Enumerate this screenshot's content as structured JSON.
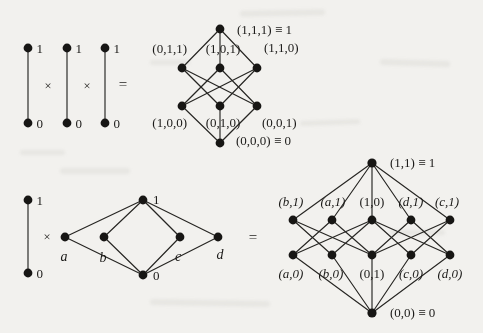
{
  "colors": {
    "paper": "#f2f1ee",
    "ink": "#1b1a18"
  },
  "operators": {
    "times": "×",
    "equals": "="
  },
  "chain": {
    "top_label": "1",
    "bottom_label": "0"
  },
  "top_figure": {
    "cube_labels": {
      "top": "(1,1,1) ≡ 1",
      "coatoms": [
        "(0,1,1)",
        "(1,0,1)",
        "(1,1,0)"
      ],
      "atoms": [
        "(1,0,0)",
        "(0,1,0)",
        "(0,0,1)"
      ],
      "bottom": "(0,0,0) ≡ 0"
    },
    "cube_edges": [
      [
        "(1,1,1)",
        "(0,1,1)"
      ],
      [
        "(1,1,1)",
        "(1,0,1)"
      ],
      [
        "(1,1,1)",
        "(1,1,0)"
      ],
      [
        "(0,1,1)",
        "(0,1,0)"
      ],
      [
        "(0,1,1)",
        "(0,0,1)"
      ],
      [
        "(1,0,1)",
        "(1,0,0)"
      ],
      [
        "(1,0,1)",
        "(0,0,1)"
      ],
      [
        "(1,1,0)",
        "(1,0,0)"
      ],
      [
        "(1,1,0)",
        "(0,1,0)"
      ],
      [
        "(1,0,0)",
        "(0,0,0)"
      ],
      [
        "(0,1,0)",
        "(0,0,0)"
      ],
      [
        "(0,0,1)",
        "(0,0,0)"
      ]
    ]
  },
  "bottom_figure": {
    "m_poset": {
      "top": "1",
      "bottom": "0",
      "atoms": [
        "a",
        "b",
        "c",
        "d"
      ]
    },
    "product": {
      "top": "(1,1) ≡ 1",
      "upper": [
        "(b,1)",
        "(a,1)",
        "(1,0)",
        "(d,1)",
        "(c,1)"
      ],
      "lower": [
        "(a,0)",
        "(b,0)",
        "(0,1)",
        "(c,0)",
        "(d,0)"
      ],
      "bottom": "(0,0) ≡ 0",
      "edges": [
        [
          "(1,1)",
          "(b,1)"
        ],
        [
          "(1,1)",
          "(a,1)"
        ],
        [
          "(1,1)",
          "(1,0)"
        ],
        [
          "(1,1)",
          "(d,1)"
        ],
        [
          "(1,1)",
          "(c,1)"
        ],
        [
          "(b,1)",
          "(b,0)"
        ],
        [
          "(b,1)",
          "(0,1)"
        ],
        [
          "(a,1)",
          "(a,0)"
        ],
        [
          "(a,1)",
          "(0,1)"
        ],
        [
          "(1,0)",
          "(a,0)"
        ],
        [
          "(1,0)",
          "(b,0)"
        ],
        [
          "(1,0)",
          "(c,0)"
        ],
        [
          "(1,0)",
          "(d,0)"
        ],
        [
          "(d,1)",
          "(0,1)"
        ],
        [
          "(d,1)",
          "(d,0)"
        ],
        [
          "(c,1)",
          "(0,1)"
        ],
        [
          "(c,1)",
          "(c,0)"
        ],
        [
          "(a,0)",
          "(0,0)"
        ],
        [
          "(b,0)",
          "(0,0)"
        ],
        [
          "(0,1)",
          "(0,0)"
        ],
        [
          "(c,0)",
          "(0,0)"
        ],
        [
          "(d,0)",
          "(0,0)"
        ]
      ]
    }
  }
}
